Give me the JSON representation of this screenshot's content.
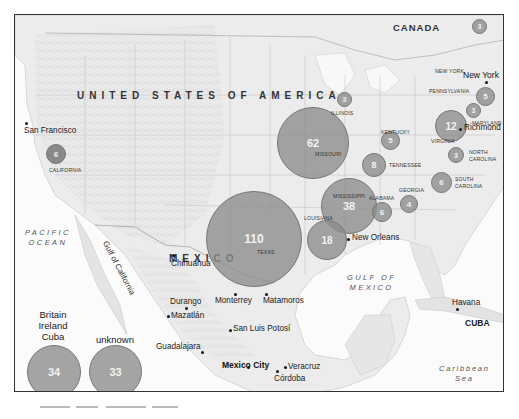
{
  "map": {
    "countries": {
      "usa": "UNITED STATES OF AMERICA",
      "canada": "CANADA",
      "mexico": "MEXICO",
      "cuba": "CUBA"
    },
    "water_bodies": {
      "pacific": "PACIFIC\nOCEAN",
      "pacific_line1": "PACIFIC",
      "pacific_line2": "OCEAN",
      "gulf_california": "Gulf of California",
      "gulf_mexico_line1": "GULF OF",
      "gulf_mexico_line2": "MEXICO",
      "caribbean_line1": "Caribbean",
      "caribbean_line2": "Sea"
    },
    "states": {
      "california": "CALIFORNIA",
      "illinois": "ILLINOIS",
      "missouri": "MISSOURI",
      "kentucky": "KENTUCKY",
      "tennessee": "TENNESSEE",
      "mississippi": "MISSISSIPPI",
      "alabama": "ALABAMA",
      "georgia": "GEORGIA",
      "louisiana": "LOUISIANA",
      "texas": "TEXAS",
      "new_york": "NEW YORK",
      "pennsylvania": "PENNSYLVANIA",
      "maryland": "MARYLAND",
      "virginia": "VIRGINIA",
      "north_carolina_1": "NORTH",
      "north_carolina_2": "CAROLINA",
      "south_carolina_1": "SOUTH",
      "south_carolina_2": "CAROLINA"
    },
    "cities": {
      "san_francisco": "San Francisco",
      "new_york": "New York",
      "richmond": "Richmond",
      "new_orleans": "New Orleans",
      "chihuahua": "Chihuahua",
      "durango": "Durango",
      "mazatlan": "Mazatlán",
      "monterrey": "Monterrey",
      "matamoros": "Matamoros",
      "san_luis_potosi": "San Luis Potosí",
      "guadalajara": "Guadalajara",
      "mexico_city": "Mexico City",
      "veracruz": "Veracruz",
      "cordoba": "Córdoba",
      "havana": "Havana"
    },
    "bubbles": [
      {
        "region": "Texas",
        "value": "110"
      },
      {
        "region": "Missouri",
        "value": "62"
      },
      {
        "region": "Mississippi",
        "value": "38"
      },
      {
        "region": "Louisiana (coast)",
        "value": "18"
      },
      {
        "region": "Virginia",
        "value": "12"
      },
      {
        "region": "Tennessee",
        "value": "8"
      },
      {
        "region": "California",
        "value": "6"
      },
      {
        "region": "Alabama",
        "value": "6"
      },
      {
        "region": "South Carolina",
        "value": "6"
      },
      {
        "region": "Kentucky",
        "value": "5"
      },
      {
        "region": "New York / Pennsylvania",
        "value": "5"
      },
      {
        "region": "Georgia",
        "value": "4"
      },
      {
        "region": "Illinois",
        "value": "3"
      },
      {
        "region": "New York (upstate)",
        "value": "3"
      },
      {
        "region": "Maryland",
        "value": "3"
      },
      {
        "region": "North Carolina",
        "value": "3"
      }
    ],
    "legend": [
      {
        "title_1": "Britain",
        "title_2": "Ireland",
        "title_3": "Cuba",
        "value": "34"
      },
      {
        "title_1": "unknown",
        "value": "33"
      }
    ],
    "colors": {
      "bubble_fill": "#8c8c8c",
      "bubble_text": "#f2f2f2",
      "frame": "#333333",
      "land": "#eeeeee",
      "water": "#fafafa"
    }
  }
}
